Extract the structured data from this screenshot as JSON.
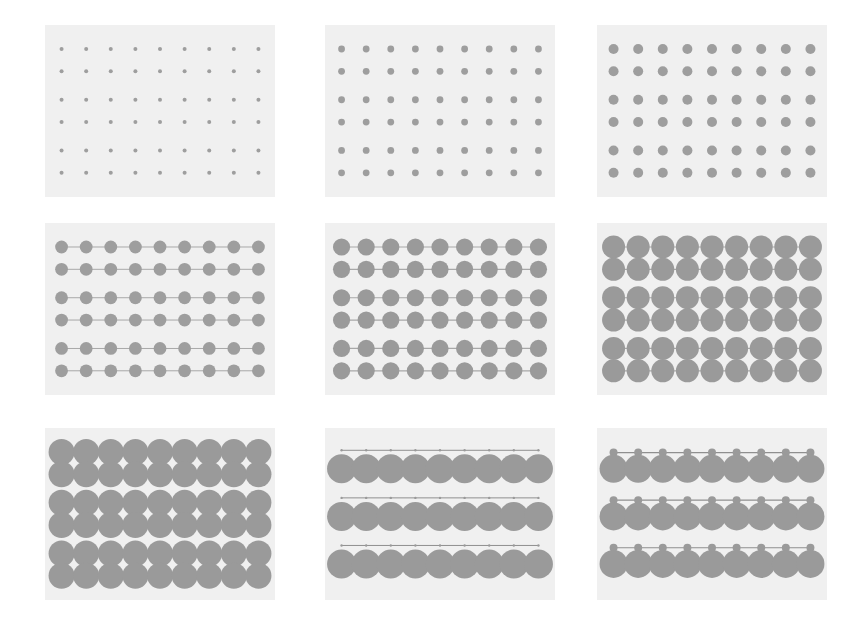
{
  "figure": {
    "width": 860,
    "height": 619,
    "page_background": "#ffffff",
    "panel_background": "#f0f0f0",
    "marker_color": "#9a9a9a",
    "edge_color": "#9a9a9a",
    "rows": 3,
    "cols": 3,
    "panel_count": 9
  },
  "grid": {
    "panel_width": 230,
    "panel_height": 172,
    "col_x": [
      45,
      325,
      597
    ],
    "row_y": [
      25,
      223,
      428
    ]
  },
  "layout": {
    "node_rows": 6,
    "node_cols": 9,
    "row_groups": 3,
    "rows_per_group": 2,
    "margin_x": 0.072,
    "margin_y": 0.085,
    "group_gap": 0.055
  },
  "chart_data": {
    "type": "scatter",
    "title": "",
    "subtitle": "",
    "xlabel": "",
    "ylabel": "",
    "legend": [],
    "grid": false,
    "panels": [
      {
        "index": 0,
        "row": 0,
        "col": 0,
        "marker_radius": 2.0,
        "edge_width": 0.0,
        "edge_visible": false,
        "node_cols": 9,
        "node_rows": 6,
        "layout": "lattice",
        "node_color": "#9e9e9e",
        "edge_color": "#c9c9c9"
      },
      {
        "index": 1,
        "row": 0,
        "col": 1,
        "marker_radius": 3.4,
        "edge_width": 0.0,
        "edge_visible": false,
        "node_cols": 9,
        "node_rows": 6,
        "layout": "lattice",
        "node_color": "#9e9e9e",
        "edge_color": "#c9c9c9"
      },
      {
        "index": 2,
        "row": 0,
        "col": 2,
        "marker_radius": 5.0,
        "edge_width": 0.0,
        "edge_visible": false,
        "node_cols": 9,
        "node_rows": 6,
        "layout": "lattice",
        "node_color": "#9e9e9e",
        "edge_color": "#c9c9c9"
      },
      {
        "index": 3,
        "row": 1,
        "col": 0,
        "marker_radius": 6.4,
        "edge_width": 1.0,
        "edge_visible": true,
        "node_cols": 9,
        "node_rows": 6,
        "layout": "lattice-linked",
        "node_color": "#9e9e9e",
        "edge_color": "#a8a8a8"
      },
      {
        "index": 4,
        "row": 1,
        "col": 1,
        "marker_radius": 8.6,
        "edge_width": 1.2,
        "edge_visible": true,
        "node_cols": 9,
        "node_rows": 6,
        "layout": "lattice-linked",
        "node_color": "#9a9a9a",
        "edge_color": "#a8a8a8"
      },
      {
        "index": 5,
        "row": 1,
        "col": 2,
        "marker_radius": 11.5,
        "edge_width": 1.2,
        "edge_visible": true,
        "node_cols": 9,
        "node_rows": 6,
        "layout": "lattice-linked",
        "node_color": "#9a9a9a",
        "edge_color": "#a8a8a8"
      },
      {
        "index": 6,
        "row": 2,
        "col": 0,
        "marker_radius": 13.0,
        "edge_width": 1.2,
        "edge_visible": true,
        "node_cols": 9,
        "node_rows": 6,
        "layout": "lattice-linked",
        "node_color": "#9a9a9a",
        "edge_color": "#a8a8a8"
      },
      {
        "index": 7,
        "row": 2,
        "col": 1,
        "marker_radius": 14.5,
        "edge_width": 1.0,
        "edge_visible": true,
        "node_cols": 9,
        "node_rows": 3,
        "layout": "rows-with-header-line",
        "node_color": "#9a9a9a",
        "edge_color": "#8f8f8f",
        "header_node_radius": 1.2
      },
      {
        "index": 8,
        "row": 2,
        "col": 2,
        "marker_radius": 14.0,
        "edge_width": 1.2,
        "edge_visible": true,
        "node_cols": 9,
        "node_rows": 3,
        "layout": "rows-with-node-chain",
        "node_color": "#9a9a9a",
        "edge_color": "#8f8f8f",
        "header_node_radius": 4.0
      }
    ]
  }
}
